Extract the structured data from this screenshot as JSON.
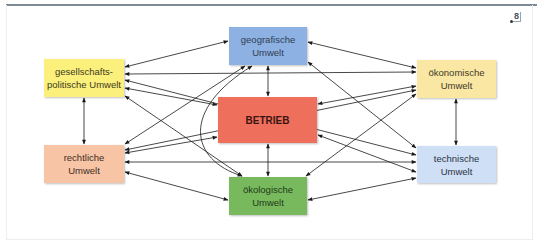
{
  "reference_marker": "8",
  "diagram": {
    "nodes": [
      {
        "id": "geo",
        "label": "geografische\nUmwelt",
        "color": "#8db1e2"
      },
      {
        "id": "ges",
        "label": "gesellschafts-\npolitische Umwelt",
        "color": "#fbf07c"
      },
      {
        "id": "oek",
        "label": "ökonomische\nUmwelt",
        "color": "#fae7a3"
      },
      {
        "id": "bet",
        "label": "BETRIEB",
        "color": "#ef6f5d"
      },
      {
        "id": "rec",
        "label": "rechtliche\nUmwelt",
        "color": "#f8c4a6"
      },
      {
        "id": "tec",
        "label": "technische\nUmwelt",
        "color": "#cfdff5"
      },
      {
        "id": "okol",
        "label": "ökologische\nUmwelt",
        "color": "#78b95e"
      }
    ],
    "edges": [
      {
        "from": "ges",
        "to": "geo",
        "bidirectional": true
      },
      {
        "from": "ges",
        "to": "oek",
        "bidirectional": true
      },
      {
        "from": "ges",
        "to": "bet",
        "bidirectional": true
      },
      {
        "from": "ges",
        "to": "rec",
        "bidirectional": true
      },
      {
        "from": "ges",
        "to": "okol",
        "bidirectional": true
      },
      {
        "from": "ges",
        "to": "tec",
        "bidirectional": true
      },
      {
        "from": "rec",
        "to": "geo",
        "bidirectional": true
      },
      {
        "from": "rec",
        "to": "bet",
        "bidirectional": true
      },
      {
        "from": "rec",
        "to": "tec",
        "bidirectional": true
      },
      {
        "from": "rec",
        "to": "okol",
        "bidirectional": true
      },
      {
        "from": "rec",
        "to": "oek",
        "bidirectional": true
      },
      {
        "from": "geo",
        "to": "oek",
        "bidirectional": true
      },
      {
        "from": "geo",
        "to": "tec",
        "bidirectional": true
      },
      {
        "from": "geo",
        "to": "bet",
        "bidirectional": true
      },
      {
        "from": "geo",
        "to": "okol",
        "bidirectional": true,
        "curved": true
      },
      {
        "from": "oek",
        "to": "bet",
        "bidirectional": true
      },
      {
        "from": "oek",
        "to": "okol",
        "bidirectional": true
      },
      {
        "from": "oek",
        "to": "tec",
        "bidirectional": true
      },
      {
        "from": "tec",
        "to": "bet",
        "bidirectional": true
      },
      {
        "from": "tec",
        "to": "okol",
        "bidirectional": true
      },
      {
        "from": "bet",
        "to": "okol",
        "bidirectional": true
      }
    ]
  }
}
